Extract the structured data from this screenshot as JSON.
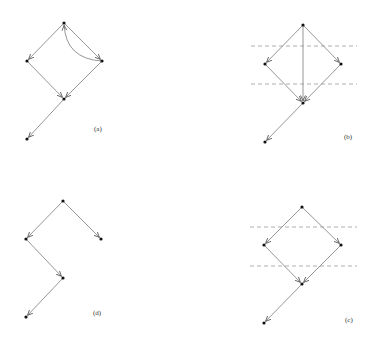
{
  "figure": {
    "panels": [
      {
        "id": "a",
        "label": "(a)",
        "label_pos": [
          94,
          131
        ],
        "nodes": [
          [
            64,
            23
          ],
          [
            27,
            61
          ],
          [
            102,
            61
          ],
          [
            64,
            99
          ],
          [
            27,
            139
          ]
        ],
        "edges": [
          [
            0,
            1
          ],
          [
            0,
            2
          ],
          [
            1,
            3
          ],
          [
            2,
            3
          ],
          [
            3,
            4
          ]
        ],
        "arcs": [
          {
            "from": 2,
            "to": 0,
            "bend": 12
          }
        ],
        "dashed_lines": []
      },
      {
        "id": "b",
        "label": "(b)",
        "label_pos": [
          344,
          139
        ],
        "nodes": [
          [
            303,
            25
          ],
          [
            265,
            64
          ],
          [
            341,
            64
          ],
          [
            303,
            103
          ],
          [
            265,
            142
          ]
        ],
        "edges": [
          [
            0,
            1
          ],
          [
            0,
            2
          ],
          [
            0,
            3
          ],
          [
            1,
            3
          ],
          [
            2,
            3
          ],
          [
            3,
            4
          ]
        ],
        "arcs": [],
        "dashed_lines": [
          {
            "y": 46,
            "x1": 251,
            "x2": 357
          },
          {
            "y": 84,
            "x1": 251,
            "x2": 357
          }
        ]
      },
      {
        "id": "c",
        "label": "(c)",
        "label_pos": [
          345,
          322
        ],
        "nodes": [
          [
            302,
            207
          ],
          [
            264,
            245
          ],
          [
            341,
            245
          ],
          [
            302,
            284
          ],
          [
            264,
            323
          ]
        ],
        "edges": [
          [
            0,
            1
          ],
          [
            0,
            2
          ],
          [
            1,
            3
          ],
          [
            2,
            3
          ],
          [
            3,
            4
          ]
        ],
        "arcs": [],
        "dashed_lines": [
          {
            "y": 227,
            "x1": 250,
            "x2": 357
          },
          {
            "y": 266,
            "x1": 250,
            "x2": 357
          }
        ]
      },
      {
        "id": "d",
        "label": "(d)",
        "label_pos": [
          93,
          315
        ],
        "nodes": [
          [
            63,
            201
          ],
          [
            26,
            239
          ],
          [
            101,
            239
          ],
          [
            63,
            278
          ],
          [
            26,
            317
          ]
        ],
        "edges": [
          [
            0,
            1
          ],
          [
            0,
            2
          ],
          [
            1,
            3
          ],
          [
            3,
            4
          ]
        ],
        "arcs": [],
        "dashed_lines": []
      }
    ],
    "colors": {
      "edge": "#8a8a8a",
      "node": "#111111",
      "dashed": "#9a9a9a",
      "label": "#333333"
    }
  }
}
